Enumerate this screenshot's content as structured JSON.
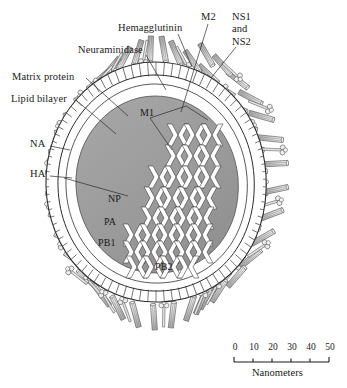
{
  "figure": {
    "background_color": "#ffffff",
    "ink_color": "#1a1a1a",
    "core_fill": "#9a9a9a",
    "envelope_fill": "#d9d9d9",
    "spike_fill": "#e3e3e3"
  },
  "outer_labels": [
    {
      "id": "hemagglutinin",
      "text": "Hemagglutinin",
      "x": 120,
      "y": 28
    },
    {
      "id": "neuraminidase",
      "text": "Neuraminidase",
      "x": 80,
      "y": 49
    },
    {
      "id": "matrix-protein",
      "text": "Matrix protein",
      "x": 14,
      "y": 76
    },
    {
      "id": "lipid-bilayer",
      "text": "Lipid bilayer",
      "x": 12,
      "y": 98
    },
    {
      "id": "m2",
      "text": "M2",
      "x": 203,
      "y": 16
    },
    {
      "id": "na",
      "text": "NA",
      "x": 32,
      "y": 143
    },
    {
      "id": "ha",
      "text": "HA",
      "x": 32,
      "y": 173
    }
  ],
  "stacked_label": {
    "id": "ns1-and-ns2",
    "lines": [
      "NS1",
      "and",
      "NS2"
    ],
    "x": 234,
    "y": 16
  },
  "inner_labels": [
    {
      "id": "m1",
      "text": "M1",
      "x": 141,
      "y": 112
    },
    {
      "id": "np",
      "text": "NP",
      "x": 110,
      "y": 198
    },
    {
      "id": "pa",
      "text": "PA",
      "x": 105,
      "y": 221
    },
    {
      "id": "pb1",
      "text": "PB1",
      "x": 100,
      "y": 242
    },
    {
      "id": "pb2",
      "text": "PB2",
      "x": 157,
      "y": 266
    }
  ],
  "scale_bar": {
    "caption": "Nanometers",
    "unit": "nm",
    "ticks": [
      {
        "value": "0",
        "x": 234
      },
      {
        "value": "10",
        "x": 253
      },
      {
        "value": "20",
        "x": 272
      },
      {
        "value": "30",
        "x": 291
      },
      {
        "value": "40",
        "x": 310
      },
      {
        "value": "50",
        "x": 329
      }
    ],
    "bar_x_start": 234,
    "bar_x_end": 329,
    "bar_y": 362,
    "caption_x": 254,
    "caption_y": 369
  },
  "structure": {
    "rnp_segment_count": 8,
    "spike_types": [
      "hemagglutinin-rod",
      "neuraminidase-mushroom"
    ],
    "envelope_layers": [
      "lipid bilayer",
      "matrix protein layer"
    ]
  }
}
